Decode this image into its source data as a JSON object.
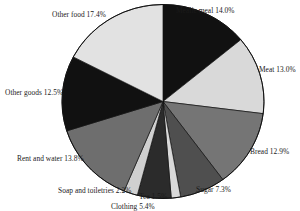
{
  "chart_data": {
    "type": "pie",
    "title": "",
    "subtitle": "",
    "xlabel": "",
    "ylabel": "",
    "legend_position": "none",
    "grid": false,
    "value_suffix": "%",
    "start_angle_deg": 0,
    "direction": "clockwise",
    "categories": [
      "Mealie meal",
      "Meat",
      "Bread",
      "Sugar",
      "Tea",
      "Clothing",
      "Soap and toiletries",
      "Rent and water",
      "Other goods",
      "Other food"
    ],
    "values": [
      14.0,
      13.0,
      12.9,
      7.3,
      1.5,
      5.4,
      2.2,
      13.8,
      12.5,
      17.4
    ],
    "colors": [
      "#111111",
      "#d9d9d9",
      "#757575",
      "#4f4f4f",
      "#d9d9d9",
      "#2b2b2b",
      "#d0d0d0",
      "#6e6e6e",
      "#111111",
      "#e2e2e2"
    ],
    "slices": [
      {
        "label": "Mealie meal",
        "value": 14.0,
        "text": "Mealie meal 14.0%",
        "color": "#111111"
      },
      {
        "label": "Meat",
        "value": 13.0,
        "text": "Meat 13.0%",
        "color": "#d9d9d9"
      },
      {
        "label": "Bread",
        "value": 12.9,
        "text": "Bread 12.9%",
        "color": "#757575"
      },
      {
        "label": "Sugar",
        "value": 7.3,
        "text": "Sugar 7.3%",
        "color": "#4f4f4f"
      },
      {
        "label": "Tea",
        "value": 1.5,
        "text": "Tea 1.5%",
        "color": "#d9d9d9"
      },
      {
        "label": "Clothing",
        "value": 5.4,
        "text": "Clothing 5.4%",
        "color": "#2b2b2b"
      },
      {
        "label": "Soap and toiletries",
        "value": 2.2,
        "text": "Soap and toiletries 2.2%",
        "color": "#d0d0d0"
      },
      {
        "label": "Rent and water",
        "value": 13.8,
        "text": "Rent and water 13.8%",
        "color": "#6e6e6e"
      },
      {
        "label": "Other goods",
        "value": 12.5,
        "text": "Other goods 12.5%",
        "color": "#111111"
      },
      {
        "label": "Other food",
        "value": 17.4,
        "text": "Other food 17.4%",
        "color": "#e2e2e2"
      }
    ]
  },
  "labels": {
    "mealie_meal": "Mealie meal 14.0%",
    "meat": "Meat 13.0%",
    "bread": "Bread 12.9%",
    "sugar": "Sugar 7.3%",
    "tea": "Tea 1.5%",
    "clothing": "Clothing 5.4%",
    "soap": "Soap and toiletries 2.2%",
    "rent": "Rent and water 13.8%",
    "other_goods": "Other goods 12.5%",
    "other_food": "Other food 17.4%"
  }
}
